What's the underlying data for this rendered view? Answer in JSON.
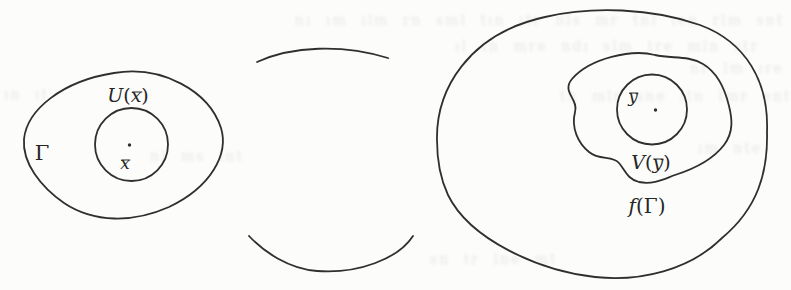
{
  "labels": {
    "left_region": "Γ",
    "left_neighborhood": {
      "func": "U",
      "open": "(",
      "var": "x",
      "close": ")"
    },
    "left_point": "x",
    "right_point": "y",
    "right_neighborhood": {
      "func": "V",
      "open": "(",
      "var": "y",
      "close": ")"
    },
    "right_region": {
      "func": "f",
      "open": "(",
      "arg": "Γ",
      "close": ")"
    }
  },
  "colors": {
    "ink": "#2f2f2f",
    "paper": "#fcfcfb",
    "bleed_text": "#7d857d"
  },
  "bleed": {
    "lines": [
      "nı ım ılm rn sml tın ıtr nls mr tnl ıen rlm snt",
      "ıl tn mre ndı slm tre mln str",
      "nr lm ıre",
      "tn mlr sne ıtn lmr ent",
      "ın ıt",
      "nl ms ınt",
      "ım nte",
      "sn tr lne mt"
    ]
  }
}
